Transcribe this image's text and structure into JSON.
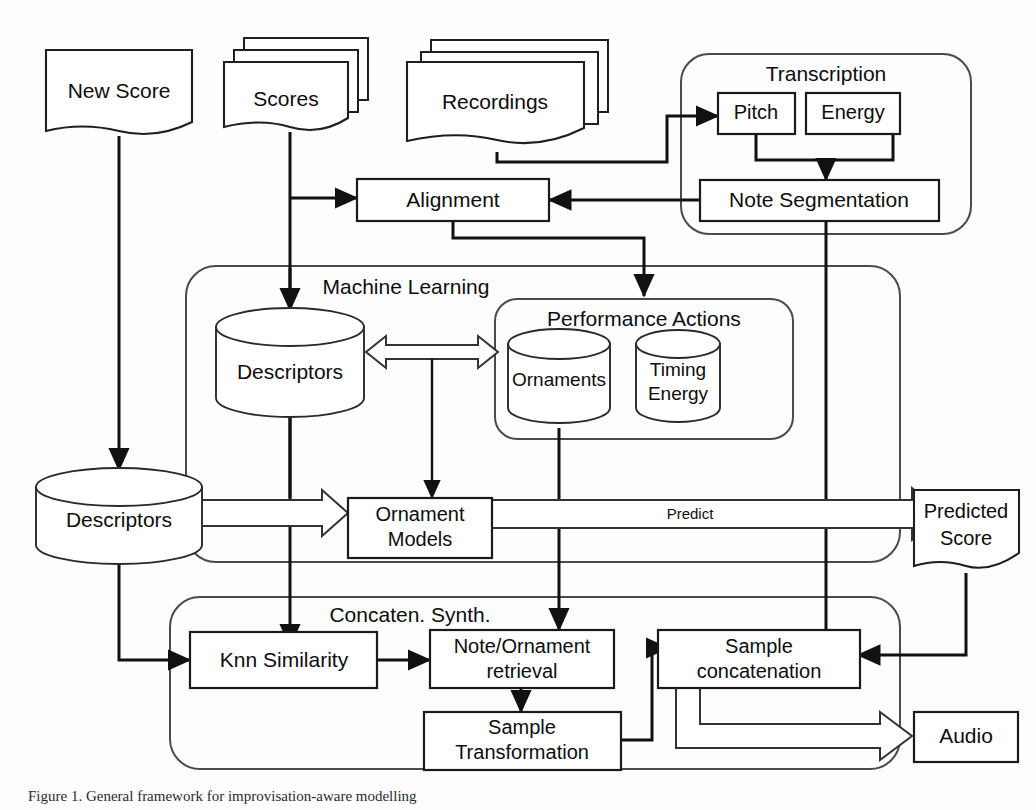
{
  "figure": {
    "caption": "Figure 1.   General framework for improvisation-aware modelling"
  },
  "nodes": {
    "new_score": "New Score",
    "scores": "Scores",
    "recordings": "Recordings",
    "transcription_panel": "Transcription",
    "pitch": "Pitch",
    "energy": "Energy",
    "note_segmentation": "Note Segmentation",
    "alignment": "Alignment",
    "machine_learning_panel": "Machine Learning",
    "ml_descriptors": "Descriptors",
    "performance_actions_panel": "Performance Actions",
    "ornaments": "Ornaments",
    "timing_line1": "Timing",
    "timing_line2": "Energy",
    "left_descriptors": "Descriptors",
    "ornament_models_line1": "Ornament",
    "ornament_models_line2": "Models",
    "predicted_score_line1": "Predicted",
    "predicted_score_line2": "Score",
    "concat_panel": "Concaten. Synth.",
    "knn_similarity": "Knn Similarity",
    "note_ornament_line1": "Note/Ornament",
    "note_ornament_line2": "retrieval",
    "sample_transformation_line1": "Sample",
    "sample_transformation_line2": "Transformation",
    "sample_concatenation_line1": "Sample",
    "sample_concatenation_line2": "concatenation",
    "audio": "Audio"
  },
  "edge_labels": {
    "predict": "Predict"
  },
  "colors": {
    "stroke": "#111111",
    "panel_stroke": "#4a4a4a",
    "fill": "#ffffff",
    "text": "#0d0d0d",
    "background": "#fdfdfd"
  }
}
